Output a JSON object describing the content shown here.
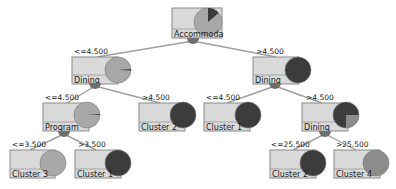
{
  "diagram": {
    "type": "decision-tree",
    "colors": {
      "box_fill": "#d9d9d9",
      "box_stroke": "#8a8a8a",
      "edge": "#a0a0a0",
      "light_cluster": "#a8a8a8",
      "dark_cluster": "#3c3c3c",
      "mid_cluster": "#8c8c8c",
      "bubble": "#6e6e6e"
    },
    "nodes": [
      {
        "id": "root",
        "label": "Accommodation",
        "label_visible": "Accommoda",
        "edge_label": "",
        "box": [
          172,
          8,
          50,
          30
        ],
        "pie": {
          "cx": 208,
          "cy": 22,
          "r": 14,
          "base": "#a8a8a8",
          "slices": [
            {
              "from": -90,
              "to": -40,
              "color": "#3c3c3c"
            }
          ]
        },
        "bubble": [
          193,
          40
        ]
      },
      {
        "id": "dining_left",
        "label": "Dining",
        "edge_label": "<=4.500",
        "box": [
          72,
          57,
          46,
          27
        ],
        "pie": {
          "cx": 118,
          "cy": 70,
          "r": 13,
          "base": "#a8a8a8",
          "slices": [
            {
              "from": -4,
              "to": 2,
              "color": "#3c3c3c"
            }
          ]
        },
        "bubble": [
          95,
          85
        ]
      },
      {
        "id": "dining_right",
        "label": "Dining",
        "edge_label": ">4.500",
        "box": [
          253,
          57,
          46,
          27
        ],
        "pie": {
          "cx": 298,
          "cy": 70,
          "r": 13,
          "base": "#3c3c3c",
          "slices": []
        },
        "bubble": [
          275,
          85
        ]
      },
      {
        "id": "program",
        "label": "Program",
        "edge_label": "<=4.500",
        "box": [
          43,
          103,
          46,
          28
        ],
        "pie": {
          "cx": 87,
          "cy": 115,
          "r": 13,
          "base": "#a8a8a8",
          "slices": [
            {
              "from": -4,
              "to": 0,
              "color": "#3c3c3c"
            }
          ]
        },
        "bubble": [
          64,
          133
        ]
      },
      {
        "id": "cluster2_a",
        "label": "Cluster 2",
        "edge_label": ">4.500",
        "box": [
          139,
          103,
          46,
          28
        ],
        "pie": {
          "cx": 183,
          "cy": 115,
          "r": 13,
          "base": "#3c3c3c",
          "slices": []
        },
        "bubble": null
      },
      {
        "id": "cluster1_a",
        "label": "Cluster 1",
        "edge_label": "<=4.500",
        "box": [
          204,
          103,
          46,
          28
        ],
        "pie": {
          "cx": 248,
          "cy": 115,
          "r": 13,
          "base": "#3c3c3c",
          "slices": []
        },
        "bubble": null
      },
      {
        "id": "dining_rr",
        "label": "Dining",
        "edge_label": ">4.500",
        "box": [
          302,
          103,
          46,
          28
        ],
        "pie": {
          "cx": 346,
          "cy": 115,
          "r": 13,
          "base": "#3c3c3c",
          "slices": [
            {
              "from": 0,
              "to": 90,
              "color": "#8c8c8c"
            }
          ]
        },
        "bubble": [
          325,
          133
        ]
      },
      {
        "id": "cluster3",
        "label": "Cluster 3",
        "edge_label": "<=3.500",
        "box": [
          10,
          150,
          45,
          28
        ],
        "pie": {
          "cx": 53,
          "cy": 163,
          "r": 13,
          "base": "#a8a8a8",
          "slices": []
        },
        "bubble": null
      },
      {
        "id": "cluster1_b",
        "label": "Cluster 1",
        "edge_label": ">3.500",
        "box": [
          75,
          150,
          46,
          28
        ],
        "pie": {
          "cx": 118,
          "cy": 163,
          "r": 13,
          "base": "#3c3c3c",
          "slices": []
        },
        "bubble": null
      },
      {
        "id": "cluster2_b",
        "label": "Cluster 2",
        "edge_label": "<=25.500",
        "box": [
          270,
          150,
          46,
          28
        ],
        "pie": {
          "cx": 313,
          "cy": 163,
          "r": 13,
          "base": "#3c3c3c",
          "slices": []
        },
        "bubble": null
      },
      {
        "id": "cluster4",
        "label": "Cluster 4",
        "edge_label": ">25.500",
        "box": [
          334,
          150,
          46,
          28
        ],
        "pie": {
          "cx": 376,
          "cy": 163,
          "r": 13,
          "base": "#8c8c8c",
          "slices": []
        },
        "bubble": null
      }
    ],
    "edges": [
      {
        "from": [
          193,
          41
        ],
        "to": [
          97,
          57
        ],
        "label": "<=4.500",
        "label_pos": [
          74,
          54
        ]
      },
      {
        "from": [
          193,
          41
        ],
        "to": [
          276,
          57
        ],
        "label": ">4.500",
        "label_pos": [
          256,
          54
        ]
      },
      {
        "from": [
          95,
          86
        ],
        "to": [
          67,
          103
        ],
        "label": "<=4.500",
        "label_pos": [
          45,
          100
        ]
      },
      {
        "from": [
          95,
          86
        ],
        "to": [
          160,
          103
        ],
        "label": ">4.500",
        "label_pos": [
          142,
          100
        ]
      },
      {
        "from": [
          275,
          86
        ],
        "to": [
          227,
          103
        ],
        "label": "<=4.500",
        "label_pos": [
          206,
          100
        ]
      },
      {
        "from": [
          275,
          86
        ],
        "to": [
          322,
          103
        ],
        "label": ">4.500",
        "label_pos": [
          306,
          100
        ]
      },
      {
        "from": [
          64,
          134
        ],
        "to": [
          30,
          150
        ],
        "label": "<=3.500",
        "label_pos": [
          12,
          147
        ]
      },
      {
        "from": [
          64,
          134
        ],
        "to": [
          96,
          150
        ],
        "label": ">3.500",
        "label_pos": [
          78,
          147
        ]
      },
      {
        "from": [
          325,
          134
        ],
        "to": [
          293,
          150
        ],
        "label": "<=25.500",
        "label_pos": [
          271,
          147
        ]
      },
      {
        "from": [
          325,
          134
        ],
        "to": [
          356,
          150
        ],
        "label": ">25.500",
        "label_pos": [
          336,
          147
        ]
      }
    ]
  }
}
